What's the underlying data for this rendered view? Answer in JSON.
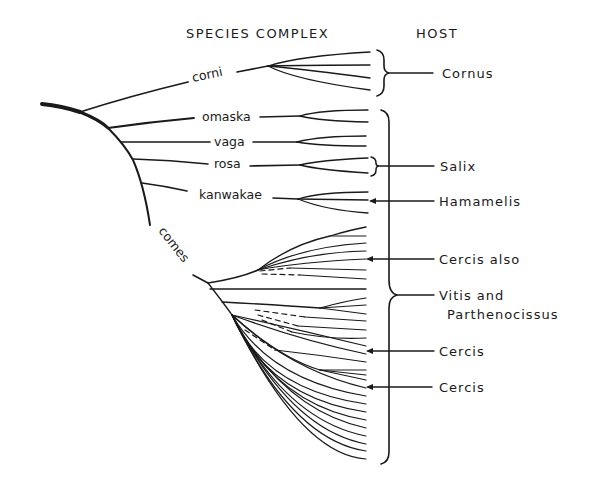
{
  "headers": {
    "species_complex": "SPECIES COMPLEX",
    "host": "HOST"
  },
  "species_complexes": [
    {
      "name": "corni",
      "tips": 4,
      "host": "Cornus"
    },
    {
      "name": "omaska",
      "tips": 2
    },
    {
      "name": "vaga",
      "tips": 2
    },
    {
      "name": "rosa",
      "tips": 2,
      "host": "Salix"
    },
    {
      "name": "kanwakae",
      "tips": 3,
      "host": "Hamamelis"
    },
    {
      "name": "comes",
      "tips": 31
    }
  ],
  "hosts": [
    {
      "label": "Cornus",
      "type": "bracket",
      "target": "corni"
    },
    {
      "label": "Salix",
      "type": "bracket",
      "target": "rosa"
    },
    {
      "label": "Hamamelis",
      "type": "arrow",
      "target": "kanwakae"
    },
    {
      "label": "Cercis also",
      "type": "arrow",
      "target": "comes"
    },
    {
      "label": "Vitis and",
      "label_line2": "Parthenocissus",
      "type": "bracket",
      "target": "omaska-through-comes"
    },
    {
      "label": "Cercis",
      "type": "arrow",
      "target": "comes"
    },
    {
      "label": "Cercis",
      "type": "arrow",
      "target": "comes"
    }
  ],
  "colors": {
    "ink": "#1a1a1a",
    "background": "#ffffff"
  }
}
